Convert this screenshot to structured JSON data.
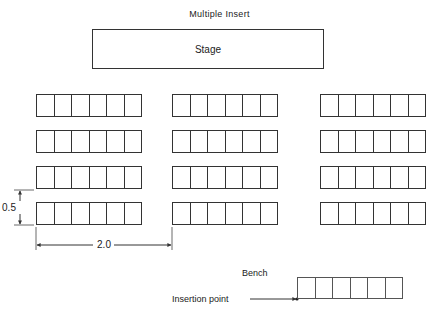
{
  "title": "Multiple Insert",
  "stage": {
    "label": "Stage"
  },
  "bench_grid": {
    "columns": [
      {
        "x": 36
      },
      {
        "x": 172
      },
      {
        "x": 320
      }
    ],
    "rows": [
      {
        "y": 94
      },
      {
        "y": 130
      },
      {
        "y": 166
      },
      {
        "y": 202
      }
    ],
    "bench_width": 106,
    "bench_height": 23,
    "seats_per_bench": 6
  },
  "dimensions": {
    "vertical": {
      "label": "0.5"
    },
    "horizontal": {
      "label": "2.0"
    }
  },
  "legend": {
    "bench_label": "Bench",
    "insertion_point_label": "Insertion point"
  },
  "colors": {
    "line": "#333333",
    "background": "#ffffff"
  }
}
